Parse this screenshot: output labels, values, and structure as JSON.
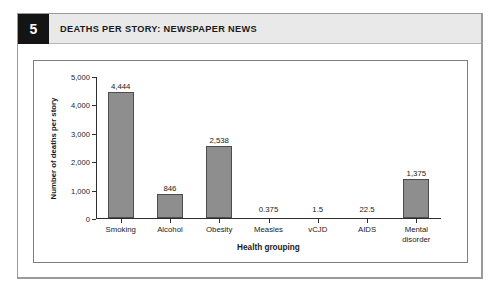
{
  "figure": {
    "number": "5",
    "title": "DEATHS PER STORY: NEWSPAPER NEWS"
  },
  "chart_data": {
    "type": "bar",
    "title": "DEATHS PER STORY: NEWSPAPER NEWS",
    "xlabel": "Health grouping",
    "ylabel": "Number of deaths per story",
    "ylim": [
      0,
      5000
    ],
    "yticks": [
      0,
      1000,
      2000,
      3000,
      4000,
      5000
    ],
    "ytick_labels": [
      "0",
      "1,000",
      "2,000",
      "3,000",
      "4,000",
      "5,000"
    ],
    "grid": false,
    "legend": "none",
    "bar_color": "#8e8e8e",
    "bar_edge_color": "#4d4d4d",
    "categories": [
      "Smoking",
      "Alcohol",
      "Obesity",
      "Measles",
      "vCJD",
      "AIDS",
      "Mental\ndisorder"
    ],
    "values": [
      4444,
      846,
      2538,
      0.375,
      1.5,
      22.5,
      1375
    ],
    "value_labels": [
      "4,444",
      "846",
      "2,538",
      "0.375",
      "1.5",
      "22.5",
      "1,375"
    ]
  }
}
